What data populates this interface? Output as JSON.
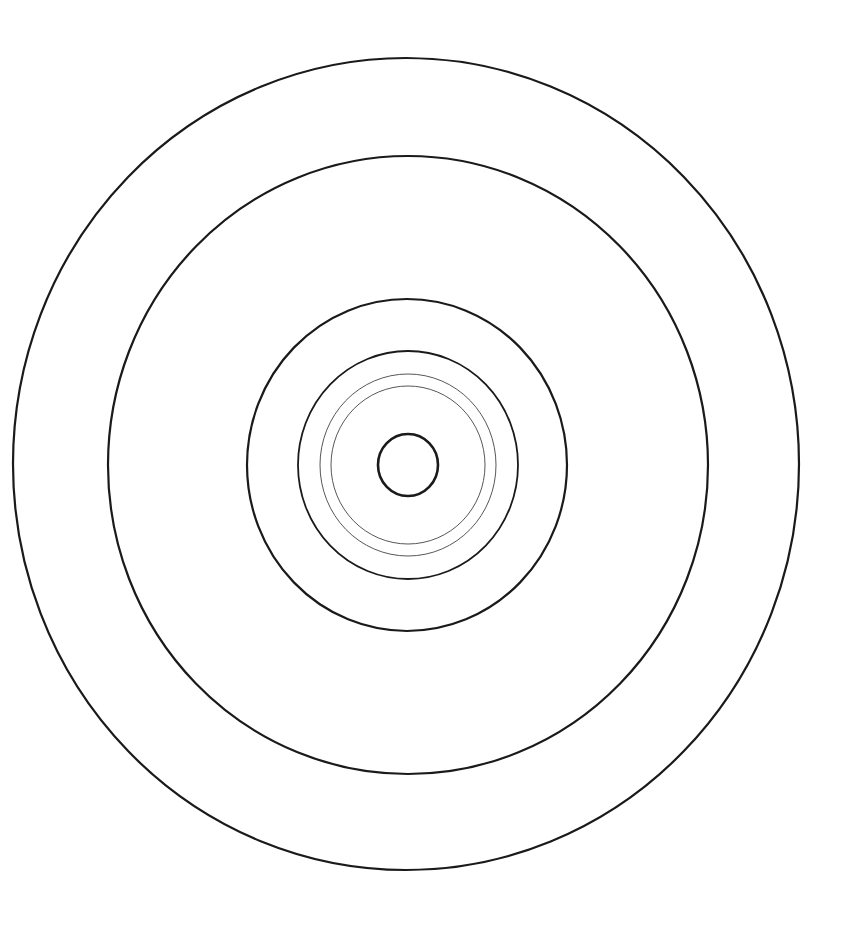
{
  "diagram": {
    "type": "concentric-circles",
    "background": "#ffffff",
    "stroke_color": "#1a1a1a",
    "rings": [
      {
        "name": "ring-outer",
        "cx": 406,
        "cy": 464,
        "rx": 393,
        "ry": 406,
        "stroke_width": 2.2,
        "stroke": "#1a1a1a"
      },
      {
        "name": "ring-2",
        "cx": 408,
        "cy": 465,
        "rx": 300,
        "ry": 309,
        "stroke_width": 2.2,
        "stroke": "#1a1a1a"
      },
      {
        "name": "ring-3",
        "cx": 407,
        "cy": 465,
        "rx": 160,
        "ry": 166,
        "stroke_width": 2.2,
        "stroke": "#1a1a1a"
      },
      {
        "name": "ring-4",
        "cx": 408,
        "cy": 465,
        "rx": 110,
        "ry": 114,
        "stroke_width": 1.8,
        "stroke": "#1a1a1a"
      },
      {
        "name": "ring-5-thin",
        "cx": 408,
        "cy": 465,
        "rx": 88,
        "ry": 91,
        "stroke_width": 0.9,
        "stroke": "#444444"
      },
      {
        "name": "ring-6-thin",
        "cx": 408,
        "cy": 465,
        "rx": 77,
        "ry": 79,
        "stroke_width": 0.9,
        "stroke": "#444444"
      },
      {
        "name": "ring-inner",
        "cx": 408,
        "cy": 465,
        "rx": 30,
        "ry": 31,
        "stroke_width": 2.6,
        "stroke": "#1a1a1a"
      }
    ]
  }
}
